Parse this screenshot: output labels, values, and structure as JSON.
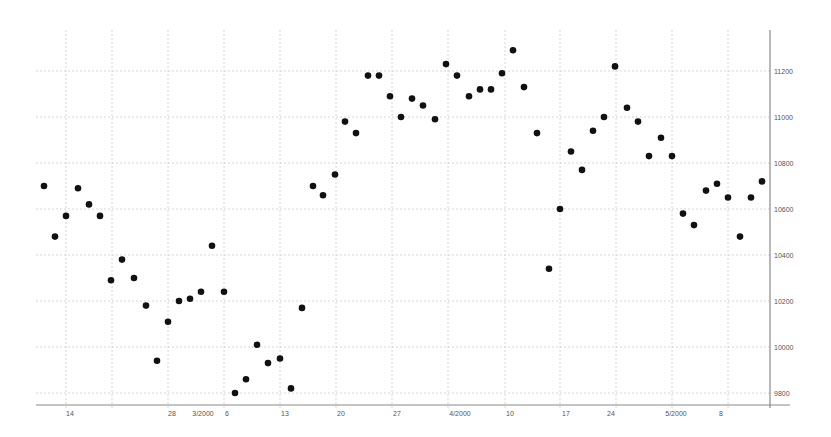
{
  "chart_data": {
    "type": "scatter",
    "title": "",
    "xlabel": "",
    "ylabel": "",
    "ylim": [
      9750,
      11400
    ],
    "grid": true,
    "legend": null,
    "y_axis_position": "right",
    "y_ticks": [
      9800,
      10000,
      10200,
      10400,
      10600,
      10800,
      11000,
      11200
    ],
    "y_tick_labels": [
      "9800",
      "10000",
      "10200",
      "10400",
      "10600",
      "10800",
      "11000",
      "11200"
    ],
    "x_tick_labels": [
      "14",
      "28",
      "3/2000",
      "6",
      "13",
      "20",
      "27",
      "4/2000",
      "10",
      "17",
      "24",
      "5/2000",
      "8"
    ],
    "x_tick_pixels": [
      70,
      172,
      203,
      227,
      285,
      341,
      397,
      460,
      510,
      566,
      611,
      676,
      721
    ],
    "point_color": "#111111",
    "points": [
      {
        "x": 44,
        "y": 10700
      },
      {
        "x": 55,
        "y": 10480
      },
      {
        "x": 66,
        "y": 10570
      },
      {
        "x": 78,
        "y": 10690
      },
      {
        "x": 89,
        "y": 10620
      },
      {
        "x": 100,
        "y": 10570
      },
      {
        "x": 111,
        "y": 10290
      },
      {
        "x": 122,
        "y": 10380
      },
      {
        "x": 134,
        "y": 10300
      },
      {
        "x": 146,
        "y": 10180
      },
      {
        "x": 157,
        "y": 9940
      },
      {
        "x": 168,
        "y": 10110
      },
      {
        "x": 179,
        "y": 10200
      },
      {
        "x": 190,
        "y": 10210
      },
      {
        "x": 201,
        "y": 10240
      },
      {
        "x": 212,
        "y": 10440
      },
      {
        "x": 224,
        "y": 10240
      },
      {
        "x": 235,
        "y": 9800
      },
      {
        "x": 246,
        "y": 9860
      },
      {
        "x": 257,
        "y": 10010
      },
      {
        "x": 268,
        "y": 9930
      },
      {
        "x": 280,
        "y": 9950
      },
      {
        "x": 291,
        "y": 9820
      },
      {
        "x": 302,
        "y": 10170
      },
      {
        "x": 313,
        "y": 10700
      },
      {
        "x": 323,
        "y": 10660
      },
      {
        "x": 335,
        "y": 10750
      },
      {
        "x": 345,
        "y": 10980
      },
      {
        "x": 356,
        "y": 10930
      },
      {
        "x": 368,
        "y": 11180
      },
      {
        "x": 379,
        "y": 11180
      },
      {
        "x": 390,
        "y": 11090
      },
      {
        "x": 401,
        "y": 11000
      },
      {
        "x": 412,
        "y": 11080
      },
      {
        "x": 423,
        "y": 11050
      },
      {
        "x": 435,
        "y": 10990
      },
      {
        "x": 446,
        "y": 11230
      },
      {
        "x": 457,
        "y": 11180
      },
      {
        "x": 469,
        "y": 11090
      },
      {
        "x": 480,
        "y": 11120
      },
      {
        "x": 491,
        "y": 11120
      },
      {
        "x": 502,
        "y": 11190
      },
      {
        "x": 513,
        "y": 11290
      },
      {
        "x": 524,
        "y": 11130
      },
      {
        "x": 537,
        "y": 10930
      },
      {
        "x": 549,
        "y": 10340
      },
      {
        "x": 560,
        "y": 10600
      },
      {
        "x": 571,
        "y": 10850
      },
      {
        "x": 582,
        "y": 10770
      },
      {
        "x": 593,
        "y": 10940
      },
      {
        "x": 604,
        "y": 11000
      },
      {
        "x": 615,
        "y": 11220
      },
      {
        "x": 627,
        "y": 11040
      },
      {
        "x": 638,
        "y": 10980
      },
      {
        "x": 649,
        "y": 10830
      },
      {
        "x": 661,
        "y": 10910
      },
      {
        "x": 672,
        "y": 10830
      },
      {
        "x": 683,
        "y": 10580
      },
      {
        "x": 694,
        "y": 10530
      },
      {
        "x": 706,
        "y": 10680
      },
      {
        "x": 717,
        "y": 10710
      },
      {
        "x": 728,
        "y": 10650
      },
      {
        "x": 740,
        "y": 10480
      },
      {
        "x": 751,
        "y": 10650
      },
      {
        "x": 762,
        "y": 10720
      }
    ]
  }
}
